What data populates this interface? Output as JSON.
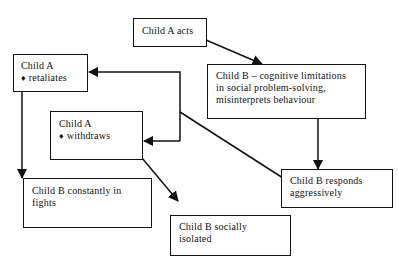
{
  "diagram": {
    "nodes": {
      "child_a_acts": {
        "lines": [
          "Child A acts"
        ]
      },
      "child_b_cognitive": {
        "lines": [
          "Child B – cognitive limitations",
          "in social problem-solving,",
          "misinterprets behaviour"
        ]
      },
      "child_a_retaliates": {
        "title": "Child A",
        "bullet": "♦",
        "item": "retaliates"
      },
      "child_a_withdraws": {
        "title": "Child A",
        "bullet": "♦",
        "item": "withdraws"
      },
      "child_b_fights": {
        "lines": [
          "Child B constantly in",
          "fights"
        ]
      },
      "child_b_isolated": {
        "lines": [
          "Child B socially",
          "isolated"
        ]
      },
      "child_b_aggressive": {
        "lines": [
          "Child B responds",
          "aggressively"
        ]
      }
    },
    "edges": [
      {
        "from": "child_a_acts",
        "to": "child_b_cognitive"
      },
      {
        "from": "child_b_cognitive",
        "to": "child_b_aggressive"
      },
      {
        "from": "child_b_aggressive",
        "to": "child_a_retaliates"
      },
      {
        "from": "child_b_aggressive",
        "to": "child_a_withdraws"
      },
      {
        "from": "child_a_retaliates",
        "to": "child_b_fights"
      },
      {
        "from": "child_a_withdraws",
        "to": "child_b_isolated"
      }
    ],
    "colors": {
      "stroke": "#111111",
      "background": "#ffffff"
    }
  }
}
